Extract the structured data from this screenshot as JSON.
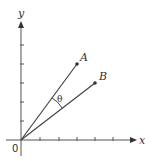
{
  "diagram": {
    "title": "",
    "axes": {
      "x_label": "x",
      "y_label": "y",
      "origin_label": "0",
      "x_ticks": 5,
      "y_ticks": 5
    },
    "vectors": [
      {
        "name": "A",
        "label": "A",
        "tip": [
          3,
          4
        ]
      },
      {
        "name": "B",
        "label": "B",
        "tip": [
          4,
          3
        ]
      }
    ],
    "angle_label": "θ",
    "colors": {
      "line": "#444444",
      "text": "#333333"
    }
  }
}
